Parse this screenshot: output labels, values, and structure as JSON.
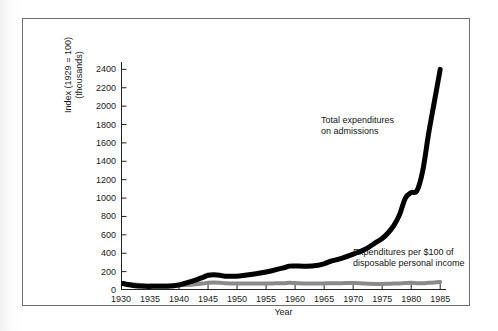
{
  "figure": {
    "frame_color": "#6e6e6e",
    "background": "#ffffff"
  },
  "axes": {
    "y_title_line1": "Index (1929 = 100)",
    "y_title_line2": "(thousands)",
    "x_title": "Year"
  },
  "annotations": {
    "total": {
      "line1": "Total expenditures",
      "line2": "on admissions"
    },
    "per100": {
      "line1": "Expenditures per $100 of",
      "line2": "disposable personal income"
    }
  },
  "chart_data": {
    "type": "line",
    "title": "",
    "subtitle": "",
    "xlabel": "Year",
    "ylabel": "Index (1929 = 100) (thousands)",
    "xlim": [
      1930,
      1986
    ],
    "ylim": [
      0,
      2480
    ],
    "xticks": [
      1930,
      1935,
      1940,
      1945,
      1950,
      1955,
      1960,
      1965,
      1970,
      1975,
      1980,
      1985
    ],
    "yticks": [
      0,
      200,
      400,
      600,
      800,
      1000,
      1200,
      1400,
      1600,
      1800,
      2000,
      2200,
      2400
    ],
    "grid": false,
    "legend_position": "inline-annotations",
    "x": [
      1930,
      1932,
      1934,
      1936,
      1938,
      1940,
      1942,
      1944,
      1945,
      1946,
      1947,
      1948,
      1950,
      1952,
      1954,
      1956,
      1958,
      1959,
      1960,
      1962,
      1964,
      1965,
      1966,
      1968,
      1970,
      1972,
      1974,
      1975,
      1976,
      1977,
      1978,
      1979,
      1980,
      1981,
      1982,
      1983,
      1984,
      1985
    ],
    "series": [
      {
        "name": "Total expenditures on admissions",
        "color": "#000000",
        "line_width": 5,
        "values": [
          75,
          50,
          40,
          40,
          42,
          55,
          90,
          135,
          160,
          165,
          160,
          150,
          150,
          165,
          185,
          210,
          240,
          260,
          262,
          258,
          270,
          285,
          310,
          345,
          390,
          440,
          520,
          560,
          620,
          700,
          820,
          1000,
          1060,
          1080,
          1300,
          1700,
          2050,
          2400
        ]
      },
      {
        "name": "Expenditures per $100 of disposable personal income",
        "color": "#8a8a8a",
        "line_width": 4,
        "values": [
          70,
          62,
          52,
          50,
          50,
          52,
          58,
          70,
          78,
          82,
          80,
          74,
          70,
          70,
          70,
          72,
          74,
          78,
          76,
          70,
          70,
          72,
          74,
          74,
          76,
          70,
          66,
          66,
          68,
          70,
          72,
          76,
          78,
          74,
          74,
          78,
          82,
          86
        ]
      }
    ]
  }
}
